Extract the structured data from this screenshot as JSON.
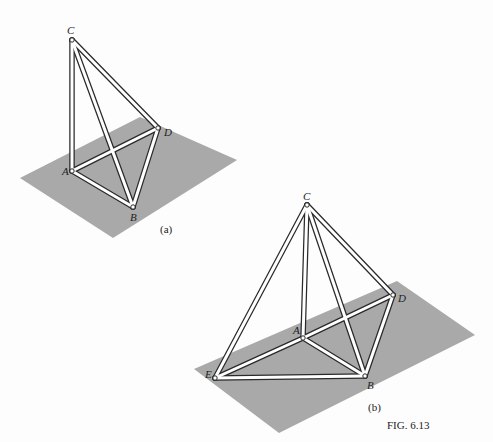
{
  "figure": {
    "caption": "FIG. 6.13",
    "panels": [
      {
        "id": "a",
        "caption": "(a)",
        "plane": [
          [
            20,
            178
          ],
          [
            140,
            117
          ],
          [
            237,
            160
          ],
          [
            113,
            238
          ]
        ],
        "nodes": {
          "A": {
            "label": "A",
            "x": 72,
            "y": 171
          },
          "B": {
            "label": "B",
            "x": 133,
            "y": 207
          },
          "C": {
            "label": "C",
            "x": 72,
            "y": 40
          },
          "D": {
            "label": "D",
            "x": 158,
            "y": 128
          }
        },
        "members": [
          [
            "C",
            "A"
          ],
          [
            "C",
            "B"
          ],
          [
            "C",
            "D"
          ],
          [
            "A",
            "B"
          ],
          [
            "A",
            "D"
          ],
          [
            "B",
            "D"
          ]
        ]
      },
      {
        "id": "b",
        "caption": "(b)",
        "plane": [
          [
            194,
            369
          ],
          [
            397,
            281
          ],
          [
            475,
            335
          ],
          [
            279,
            433
          ]
        ],
        "nodes": {
          "A": {
            "label": "A",
            "x": 303,
            "y": 338
          },
          "B": {
            "label": "B",
            "x": 365,
            "y": 376
          },
          "C": {
            "label": "C",
            "x": 307,
            "y": 205
          },
          "D": {
            "label": "D",
            "x": 393,
            "y": 295
          },
          "E": {
            "label": "E",
            "x": 215,
            "y": 378
          }
        },
        "members": [
          [
            "C",
            "E"
          ],
          [
            "C",
            "A"
          ],
          [
            "C",
            "B"
          ],
          [
            "C",
            "D"
          ],
          [
            "E",
            "A"
          ],
          [
            "A",
            "D"
          ],
          [
            "E",
            "B"
          ],
          [
            "A",
            "B"
          ],
          [
            "B",
            "D"
          ]
        ]
      }
    ]
  }
}
